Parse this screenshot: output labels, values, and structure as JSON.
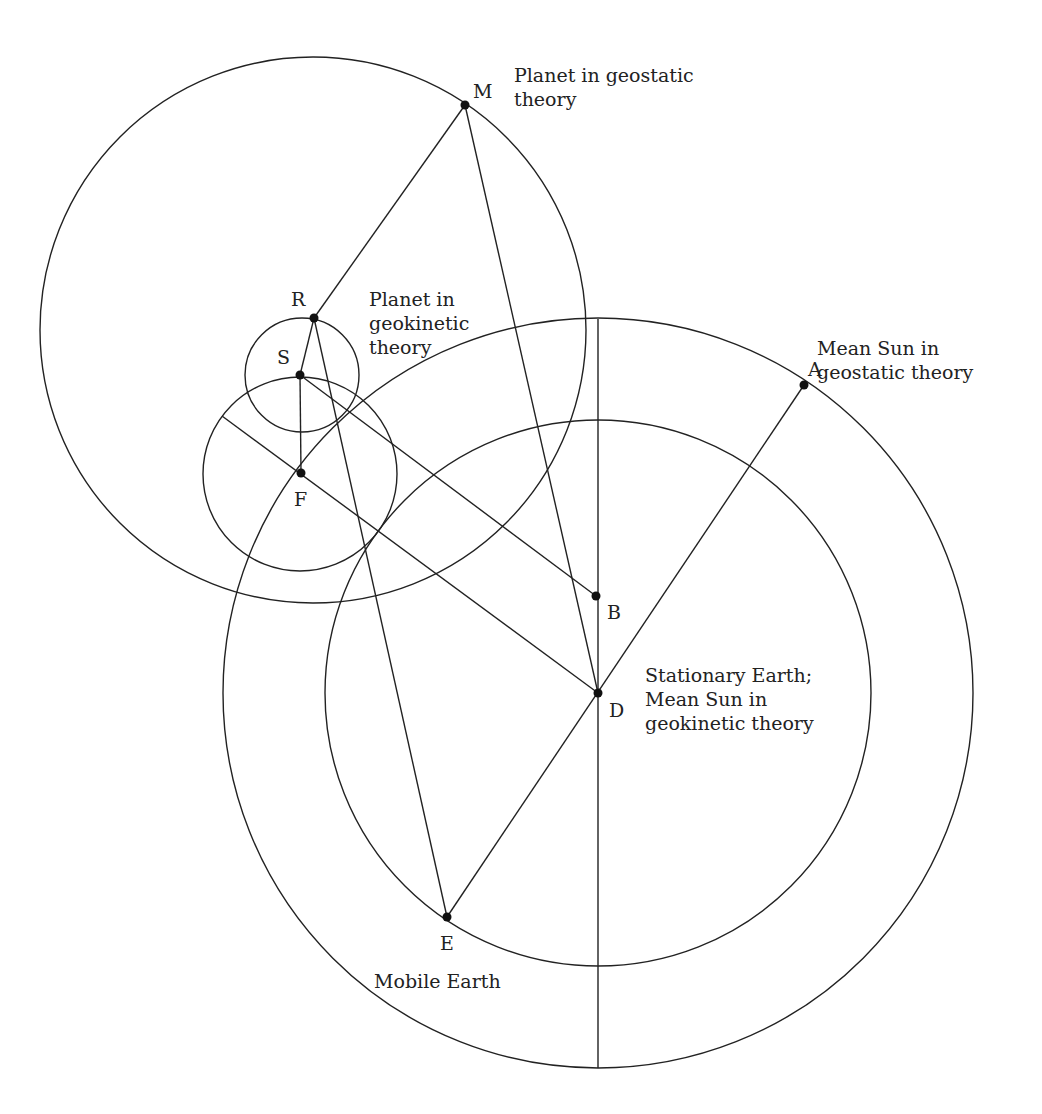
{
  "diagram": {
    "type": "geometric-astronomy-diagram",
    "circles": [
      {
        "id": "planet-deferent-geostatic",
        "cx": 313,
        "cy": 330,
        "r": 273
      },
      {
        "id": "outer-sun-circle",
        "cx": 598,
        "cy": 693,
        "r": 375
      },
      {
        "id": "inner-earth-orbit",
        "cx": 598,
        "cy": 693,
        "r": 273
      },
      {
        "id": "small-epicycle",
        "cx": 302,
        "cy": 375,
        "r": 57
      },
      {
        "id": "mid-epicycle",
        "cx": 300,
        "cy": 474,
        "r": 97
      }
    ],
    "points": [
      {
        "id": "M",
        "label": "M",
        "x": 465,
        "y": 105,
        "lx": 473,
        "ly": 98
      },
      {
        "id": "R",
        "label": "R",
        "x": 314,
        "y": 318,
        "lx": 291,
        "ly": 306
      },
      {
        "id": "S",
        "label": "S",
        "x": 300,
        "y": 375,
        "lx": 277,
        "ly": 364
      },
      {
        "id": "F",
        "label": "F",
        "x": 301,
        "y": 473,
        "lx": 294,
        "ly": 506
      },
      {
        "id": "A",
        "label": "A",
        "x": 804,
        "y": 385,
        "lx": 808,
        "ly": 376
      },
      {
        "id": "B",
        "label": "B",
        "x": 596,
        "y": 596,
        "lx": 607,
        "ly": 619
      },
      {
        "id": "D",
        "label": "D",
        "x": 598,
        "y": 693,
        "lx": 609,
        "ly": 717
      },
      {
        "id": "E",
        "label": "E",
        "x": 447,
        "y": 917,
        "lx": 440,
        "ly": 950
      }
    ],
    "lines": [
      {
        "from": "M",
        "to": "R"
      },
      {
        "from": "M",
        "to": "D"
      },
      {
        "from": "R",
        "to": "S"
      },
      {
        "from": "R",
        "to": "E"
      },
      {
        "from": "S",
        "to": "F"
      },
      {
        "from": "S",
        "to": "B"
      },
      {
        "from": "A",
        "to": "E"
      },
      {
        "x1": 222,
        "y1": 416,
        "x2": 598,
        "y2": 693
      },
      {
        "x1": 598,
        "y1": 319,
        "x2": 598,
        "y2": 1068
      }
    ],
    "annotations": [
      {
        "id": "planet-geostatic",
        "lines": [
          "Planet in geostatic",
          "theory"
        ],
        "x": 514,
        "y": 82
      },
      {
        "id": "planet-geokinetic",
        "lines": [
          "Planet in",
          "geokinetic",
          "theory"
        ],
        "x": 369,
        "y": 306
      },
      {
        "id": "mean-sun-geostatic",
        "lines": [
          "Mean Sun in",
          "geostatic theory"
        ],
        "x": 817,
        "y": 355
      },
      {
        "id": "stationary-earth",
        "lines": [
          "Stationary Earth;",
          "Mean Sun in",
          "geokinetic theory"
        ],
        "x": 645,
        "y": 682
      },
      {
        "id": "mobile-earth",
        "lines": [
          "Mobile Earth"
        ],
        "x": 374,
        "y": 988
      }
    ]
  }
}
